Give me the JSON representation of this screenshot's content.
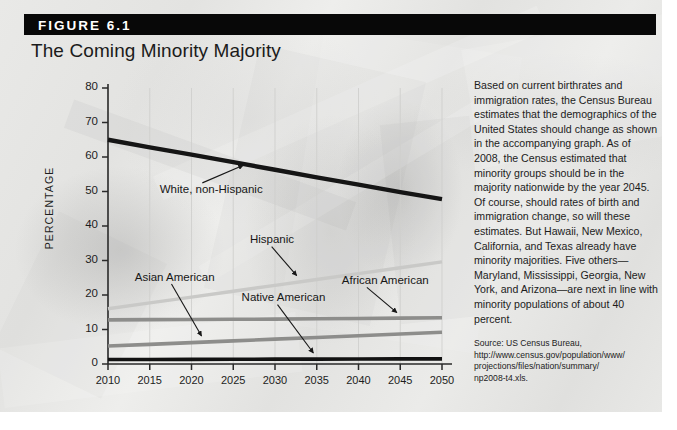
{
  "figure": {
    "number": "FIGURE 6.1",
    "title": "The Coming Minority Majority"
  },
  "caption": {
    "body": "Based on current birthrates and immigration rates, the Census Bureau estimates that the demographics of the United States should change as shown in the accompanying graph. As of 2008, the Census estimated that minority groups should be in the majority nationwide by the year 2045. Of course, should rates of birth and immigration change, so will these estimates. But Hawaii, New Mexico, California, and Texas already have minority majorities. Five others—Maryland, Mississippi, Georgia, New York, and Arizona—are next in line with minority populations of about 40 percent.",
    "source_label": "Source:",
    "source_text": "US Census Bureau,",
    "source_url_line1": "http://www.census.gov/population/www/",
    "source_url_line2": "projections/files/nation/summary/",
    "source_url_line3": "np2008-t4.xls."
  },
  "chart_data": {
    "type": "line",
    "title": "The Coming Minority Majority",
    "xlabel": "",
    "ylabel": "PERCENTAGE",
    "x": [
      2010,
      2015,
      2020,
      2025,
      2030,
      2035,
      2040,
      2045,
      2050
    ],
    "xticklabels": [
      "2010",
      "2015",
      "2020",
      "2025",
      "2030",
      "2035",
      "2040",
      "2045",
      "2050"
    ],
    "yticklabels": [
      "0",
      "10",
      "20",
      "30",
      "40",
      "50",
      "60",
      "70",
      "80"
    ],
    "xlim": [
      2010,
      2050
    ],
    "ylim": [
      0,
      80
    ],
    "ytick_step": 10,
    "grid": "vertical-faint",
    "legend": "inline-annotations",
    "series": [
      {
        "name": "White, non-Hispanic",
        "color": "#151515",
        "width": 4.4,
        "values": [
          65,
          62.8,
          60.7,
          58.5,
          56.3,
          54.1,
          52.0,
          49.8,
          47.8
        ]
      },
      {
        "name": "Hispanic",
        "color": "#c9c9c7",
        "width": 3.4,
        "values": [
          16.0,
          17.7,
          19.4,
          21.1,
          22.8,
          24.5,
          26.2,
          27.9,
          29.6
        ]
      },
      {
        "name": "African American",
        "color": "#8d8d8b",
        "width": 3.6,
        "values": [
          12.8,
          12.85,
          12.9,
          12.95,
          13.0,
          13.1,
          13.2,
          13.3,
          13.4
        ]
      },
      {
        "name": "Asian American",
        "color": "#8d8d8b",
        "width": 3.6,
        "values": [
          5.2,
          5.7,
          6.2,
          6.7,
          7.2,
          7.7,
          8.2,
          8.7,
          9.2
        ]
      },
      {
        "name": "Native American",
        "color": "#121212",
        "width": 3.6,
        "values": [
          1.3,
          1.32,
          1.35,
          1.38,
          1.4,
          1.42,
          1.45,
          1.48,
          1.5
        ]
      }
    ],
    "annotations": [
      {
        "label": "White, non-Hispanic",
        "x": 2016.2,
        "y": 50.5
      },
      {
        "label": "Hispanic",
        "x": 2027.0,
        "y": 36.0
      },
      {
        "label": "Asian American",
        "x": 2013.2,
        "y": 25.0
      },
      {
        "label": "Native American",
        "x": 2026.0,
        "y": 19.0
      },
      {
        "label": "African American",
        "x": 2038.0,
        "y": 24.0
      }
    ]
  }
}
